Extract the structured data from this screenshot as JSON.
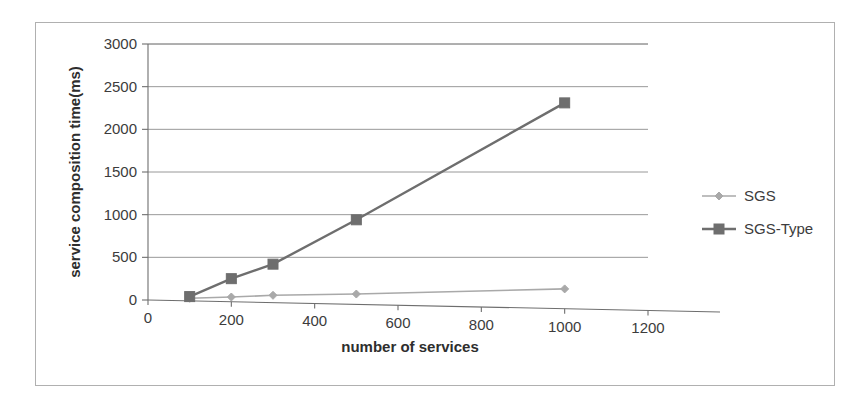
{
  "chart_data": {
    "type": "line",
    "title": "",
    "xlabel": "number of services",
    "ylabel": "service composition time(ms)",
    "xlim": [
      0,
      1200
    ],
    "ylim": [
      0,
      3000
    ],
    "xticks": [
      "0",
      "200",
      "400",
      "600",
      "800",
      "1000",
      "1200"
    ],
    "yticks": [
      "0",
      "500",
      "1000",
      "1500",
      "2000",
      "2500",
      "3000"
    ],
    "xtick_values": [
      0,
      200,
      400,
      600,
      800,
      1000,
      1200
    ],
    "ytick_values": [
      0,
      500,
      1000,
      1500,
      2000,
      2500,
      3000
    ],
    "grid": "horizontal",
    "legend_position": "right",
    "x": [
      100,
      200,
      300,
      500,
      1000
    ],
    "series": [
      {
        "name": "SGS",
        "marker": "diamond",
        "color": "#a9a9a9",
        "values": [
          20,
          35,
          55,
          70,
          130
        ]
      },
      {
        "name": "SGS-Type",
        "marker": "square",
        "color": "#6e6e6e",
        "values": [
          40,
          250,
          420,
          940,
          2310
        ]
      }
    ]
  },
  "legend": {
    "items": [
      {
        "label": "SGS",
        "marker": "diamond",
        "color": "#a9a9a9"
      },
      {
        "label": "SGS-Type",
        "marker": "square",
        "color": "#6e6e6e"
      }
    ]
  },
  "axes": {
    "x_title": "number of services",
    "y_title": "service composition time(ms)"
  }
}
